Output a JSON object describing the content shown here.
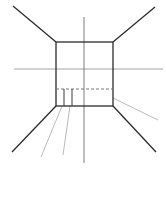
{
  "document": {
    "title": "One-Point Perspective Line Drawing",
    "description": "Technical line sketch of an interior room in one-point perspective with a central rectangular wall, radiating orthogonal lines, a horizon line and a vertical centre axis.",
    "canvas": {
      "width": 166,
      "height": 200,
      "background_color": "#ffffff"
    }
  },
  "style": {
    "stroke_dark": "#2b2b2f",
    "stroke_mid": "#58585e",
    "stroke_light": "#9a9aa0",
    "stroke_faint": "#b9b9bf",
    "width_heavy": 1.3,
    "width_medium": 1.0,
    "width_light": 0.8,
    "dash_pattern": "3 2"
  },
  "geometry": {
    "back_wall": {
      "name": "back-wall-rectangle",
      "left": 56,
      "top": 42,
      "right": 113,
      "bottom": 106,
      "stroke": "#2b2b2f",
      "stroke_width": 1.3,
      "fill": "none"
    },
    "horizon_line": {
      "name": "horizon-line",
      "x1": 14,
      "y1": 69,
      "x2": 163,
      "y2": 69,
      "stroke": "#9a9aa0",
      "stroke_width": 0.9
    },
    "vertical_axis": {
      "name": "vertical-centre-axis",
      "x1": 84,
      "y1": 17,
      "x2": 84,
      "y2": 163,
      "stroke": "#6e6e74",
      "stroke_width": 0.9
    },
    "dashed_baseline": {
      "name": "dashed-skirting-line",
      "x1": 56,
      "y1": 89,
      "x2": 113,
      "y2": 89,
      "stroke": "#7a7a80",
      "stroke_width": 1.0,
      "dash": "3 2"
    },
    "orthogonals": [
      {
        "name": "orthogonal-top-left",
        "x1": 56,
        "y1": 42,
        "x2": 13,
        "y2": 6,
        "stroke": "#2b2b2f",
        "stroke_width": 1.3
      },
      {
        "name": "orthogonal-top-right",
        "x1": 113,
        "y1": 42,
        "x2": 155,
        "y2": 7,
        "stroke": "#2b2b2f",
        "stroke_width": 1.3
      },
      {
        "name": "orthogonal-bottom-left",
        "x1": 56,
        "y1": 106,
        "x2": 12,
        "y2": 152,
        "stroke": "#2b2b2f",
        "stroke_width": 1.3
      },
      {
        "name": "orthogonal-bottom-right",
        "x1": 113,
        "y1": 106,
        "x2": 156,
        "y2": 152,
        "stroke": "#2b2b2f",
        "stroke_width": 1.3
      },
      {
        "name": "orthogonal-right-skirting",
        "x1": 113,
        "y1": 98,
        "x2": 158,
        "y2": 120,
        "stroke": "#a8a8ae",
        "stroke_width": 0.8
      },
      {
        "name": "orthogonal-left-fan-outer",
        "x1": 62,
        "y1": 106,
        "x2": 41,
        "y2": 157,
        "stroke": "#a8a8ae",
        "stroke_width": 0.8
      },
      {
        "name": "orthogonal-left-fan-inner",
        "x1": 70,
        "y1": 106,
        "x2": 63,
        "y2": 155,
        "stroke": "#a8a8ae",
        "stroke_width": 0.8
      }
    ],
    "notch": {
      "name": "floor-notch-detail",
      "left_edge": {
        "x1": 64,
        "y1": 89,
        "x2": 64,
        "y2": 106
      },
      "right_edge": {
        "x1": 72,
        "y1": 89,
        "x2": 72,
        "y2": 106
      },
      "stroke": "#3a3a40",
      "stroke_width": 1.0
    }
  },
  "labels": {
    "vanishing_point_note": "",
    "caption": ""
  }
}
